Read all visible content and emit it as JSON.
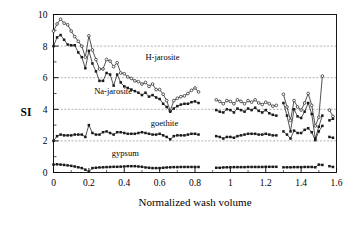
{
  "chart_data": {
    "type": "line",
    "title": "",
    "xlabel": "Normalized wash volume",
    "ylabel": "SI",
    "xlim": [
      0,
      1.6
    ],
    "ylim": [
      0,
      10
    ],
    "xticks": [
      "0",
      "0.2",
      "0.4",
      "0.6",
      "0.8",
      "1",
      "1.2",
      "1.4",
      "1.6"
    ],
    "xtick_values": [
      0,
      0.2,
      0.4,
      0.6,
      0.8,
      1.0,
      1.2,
      1.4,
      1.6
    ],
    "yticks": [
      "0",
      "2",
      "4",
      "6",
      "8",
      "10"
    ],
    "ytick_values": [
      0,
      2,
      4,
      6,
      8,
      10
    ],
    "y_minor_ticks": [
      1,
      3,
      5,
      7,
      9
    ],
    "grid": "horizontal-dashed-at-major-y",
    "gridlines_y": [
      2,
      4,
      6,
      8
    ],
    "legend_position": "inline-annotations",
    "series": [
      {
        "name": "H-jarosite",
        "marker": "open-circle",
        "label_x": 0.52,
        "label_y": 7.1,
        "x": [
          0.0,
          0.02,
          0.04,
          0.06,
          0.08,
          0.1,
          0.12,
          0.14,
          0.16,
          0.18,
          0.2,
          0.22,
          0.24,
          0.26,
          0.28,
          0.3,
          0.32,
          0.34,
          0.36,
          0.38,
          0.4,
          0.42,
          0.44,
          0.46,
          0.48,
          0.5,
          0.52,
          0.54,
          0.56,
          0.58,
          0.6,
          0.62,
          0.64,
          0.66,
          0.68,
          0.7,
          0.72,
          0.74,
          0.76,
          0.78,
          0.8,
          0.82,
          0.92,
          0.94,
          0.96,
          0.98,
          1.0,
          1.02,
          1.04,
          1.06,
          1.08,
          1.1,
          1.12,
          1.14,
          1.16,
          1.18,
          1.2,
          1.22,
          1.24,
          1.26,
          1.3,
          1.32,
          1.34,
          1.36,
          1.38,
          1.4,
          1.42,
          1.44,
          1.46,
          1.48,
          1.5,
          1.52,
          1.56,
          1.58
        ],
        "y": [
          8.95,
          9.4,
          9.7,
          9.45,
          9.35,
          8.95,
          8.6,
          8.3,
          8.0,
          7.3,
          8.65,
          7.75,
          7.15,
          6.55,
          6.55,
          7.15,
          7.05,
          6.7,
          6.95,
          6.3,
          6.25,
          6.05,
          5.95,
          5.8,
          5.75,
          5.6,
          5.7,
          5.45,
          5.6,
          5.25,
          5.25,
          4.95,
          4.55,
          3.9,
          4.55,
          4.7,
          4.8,
          4.85,
          5.0,
          5.2,
          5.35,
          5.1,
          4.6,
          4.5,
          4.35,
          4.55,
          4.5,
          4.35,
          4.6,
          4.5,
          4.35,
          4.55,
          4.45,
          4.6,
          4.4,
          4.3,
          4.45,
          4.35,
          4.2,
          4.25,
          4.95,
          4.15,
          3.3,
          4.55,
          4.15,
          3.95,
          4.4,
          5.0,
          4.25,
          2.95,
          3.5,
          6.1,
          3.95,
          3.55
        ]
      },
      {
        "name": "Na-jarosite",
        "marker": "filled-square",
        "label_x": 0.23,
        "label_y": 4.95,
        "x": [
          0.0,
          0.02,
          0.04,
          0.06,
          0.08,
          0.1,
          0.12,
          0.14,
          0.16,
          0.18,
          0.2,
          0.22,
          0.24,
          0.26,
          0.28,
          0.3,
          0.32,
          0.34,
          0.36,
          0.38,
          0.4,
          0.42,
          0.44,
          0.46,
          0.48,
          0.5,
          0.52,
          0.54,
          0.56,
          0.58,
          0.6,
          0.62,
          0.64,
          0.66,
          0.68,
          0.7,
          0.72,
          0.74,
          0.76,
          0.78,
          0.8,
          0.82,
          0.92,
          0.94,
          0.96,
          0.98,
          1.0,
          1.02,
          1.04,
          1.06,
          1.08,
          1.1,
          1.12,
          1.14,
          1.16,
          1.18,
          1.2,
          1.22,
          1.24,
          1.26,
          1.3,
          1.32,
          1.34,
          1.36,
          1.38,
          1.4,
          1.42,
          1.44,
          1.46,
          1.48,
          1.5,
          1.52,
          1.56,
          1.58
        ],
        "y": [
          8.0,
          8.55,
          8.7,
          8.4,
          8.1,
          8.05,
          8.05,
          7.6,
          7.3,
          6.6,
          7.7,
          6.9,
          6.4,
          5.8,
          5.8,
          6.3,
          6.2,
          5.5,
          6.2,
          5.7,
          5.45,
          5.35,
          5.25,
          5.15,
          5.05,
          4.9,
          5.05,
          4.8,
          4.9,
          4.75,
          4.65,
          4.35,
          4.15,
          3.85,
          4.05,
          4.2,
          4.3,
          4.35,
          4.35,
          4.45,
          4.5,
          4.4,
          3.95,
          3.85,
          3.8,
          4.0,
          3.95,
          3.8,
          4.05,
          3.95,
          3.85,
          4.05,
          3.95,
          4.1,
          3.9,
          3.8,
          3.95,
          3.75,
          3.65,
          3.6,
          4.4,
          3.6,
          2.6,
          4.0,
          3.55,
          3.45,
          3.85,
          4.4,
          3.7,
          2.15,
          2.9,
          3.6,
          3.3,
          3.4
        ]
      },
      {
        "name": "goethite",
        "marker": "filled-square",
        "label_x": 0.55,
        "label_y": 2.95,
        "x": [
          0.0,
          0.02,
          0.04,
          0.06,
          0.08,
          0.1,
          0.12,
          0.14,
          0.16,
          0.18,
          0.2,
          0.22,
          0.24,
          0.26,
          0.28,
          0.3,
          0.32,
          0.34,
          0.36,
          0.38,
          0.4,
          0.42,
          0.44,
          0.46,
          0.48,
          0.5,
          0.52,
          0.54,
          0.56,
          0.58,
          0.6,
          0.62,
          0.64,
          0.66,
          0.68,
          0.7,
          0.72,
          0.74,
          0.76,
          0.78,
          0.8,
          0.82,
          0.92,
          0.94,
          0.96,
          0.98,
          1.0,
          1.02,
          1.04,
          1.06,
          1.08,
          1.1,
          1.12,
          1.14,
          1.16,
          1.18,
          1.2,
          1.22,
          1.24,
          1.26,
          1.3,
          1.32,
          1.34,
          1.36,
          1.38,
          1.4,
          1.42,
          1.44,
          1.46,
          1.48,
          1.5,
          1.52,
          1.56,
          1.58
        ],
        "y": [
          2.0,
          2.3,
          2.4,
          2.35,
          2.35,
          2.35,
          2.4,
          2.4,
          2.4,
          2.25,
          3.0,
          2.5,
          2.4,
          2.4,
          2.55,
          2.6,
          2.5,
          2.4,
          2.55,
          2.55,
          2.5,
          2.45,
          2.45,
          2.45,
          2.5,
          2.55,
          2.5,
          2.45,
          2.4,
          2.4,
          2.45,
          2.35,
          2.25,
          2.1,
          2.3,
          2.35,
          2.35,
          2.35,
          2.4,
          2.45,
          2.45,
          2.4,
          2.3,
          2.25,
          2.15,
          2.25,
          2.25,
          2.2,
          2.3,
          2.35,
          2.4,
          2.45,
          2.45,
          2.45,
          2.4,
          2.4,
          2.45,
          2.4,
          2.35,
          2.35,
          2.6,
          2.4,
          2.15,
          2.65,
          2.5,
          2.5,
          2.7,
          2.8,
          2.55,
          2.05,
          2.6,
          2.95,
          2.25,
          2.2
        ]
      },
      {
        "name": "gypsum",
        "marker": "filled-square",
        "label_x": 0.33,
        "label_y": 1.05,
        "x": [
          0.0,
          0.02,
          0.04,
          0.06,
          0.08,
          0.1,
          0.12,
          0.14,
          0.16,
          0.18,
          0.2,
          0.22,
          0.24,
          0.26,
          0.28,
          0.3,
          0.32,
          0.34,
          0.36,
          0.38,
          0.4,
          0.42,
          0.44,
          0.46,
          0.48,
          0.5,
          0.52,
          0.54,
          0.56,
          0.58,
          0.6,
          0.62,
          0.64,
          0.66,
          0.68,
          0.7,
          0.72,
          0.74,
          0.76,
          0.78,
          0.8,
          0.82,
          0.92,
          0.94,
          0.96,
          0.98,
          1.0,
          1.02,
          1.04,
          1.06,
          1.08,
          1.1,
          1.12,
          1.14,
          1.16,
          1.18,
          1.2,
          1.22,
          1.24,
          1.26,
          1.3,
          1.32,
          1.34,
          1.36,
          1.38,
          1.4,
          1.42,
          1.44,
          1.46,
          1.48,
          1.5,
          1.52,
          1.56,
          1.58
        ],
        "y": [
          0.5,
          0.52,
          0.5,
          0.48,
          0.45,
          0.42,
          0.38,
          0.33,
          0.28,
          0.18,
          0.05,
          0.28,
          0.3,
          0.32,
          0.33,
          0.34,
          0.35,
          0.36,
          0.36,
          0.37,
          0.38,
          0.4,
          0.4,
          0.4,
          0.38,
          0.36,
          0.32,
          0.3,
          0.28,
          0.28,
          0.28,
          0.3,
          0.32,
          0.33,
          0.34,
          0.34,
          0.35,
          0.35,
          0.35,
          0.35,
          0.35,
          0.35,
          0.3,
          0.3,
          0.32,
          0.33,
          0.33,
          0.34,
          0.34,
          0.34,
          0.34,
          0.35,
          0.35,
          0.35,
          0.35,
          0.35,
          0.36,
          0.36,
          0.36,
          0.36,
          0.33,
          0.33,
          0.33,
          0.34,
          0.34,
          0.34,
          0.35,
          0.35,
          0.35,
          0.33,
          0.5,
          0.48,
          0.4,
          0.35
        ]
      }
    ]
  },
  "figure": {
    "y_axis_label": "SI",
    "x_axis_label": "Normalized wash volume"
  }
}
